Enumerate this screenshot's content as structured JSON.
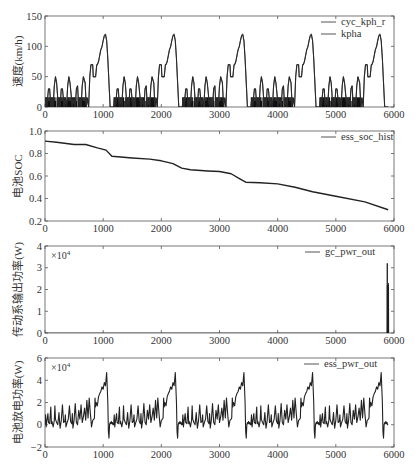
{
  "figure": {
    "x_ticks": [
      0,
      1000,
      2000,
      3000,
      4000,
      5000,
      6000
    ],
    "x_range": [
      0,
      6000
    ]
  },
  "chart_data": [
    {
      "type": "line",
      "ylabel": "速度(km/h)",
      "ylim": [
        0,
        150
      ],
      "y_ticks": [
        0,
        50,
        100,
        150
      ],
      "y_tick_labels": [
        "0",
        "50",
        "100",
        "150"
      ],
      "xlim": [
        0,
        6000
      ],
      "x_ticks": [
        0,
        1000,
        2000,
        3000,
        4000,
        5000,
        6000
      ],
      "multiplier_label": "",
      "legend": [
        "cyc_kph_r",
        "kpha"
      ],
      "legend_position": "upper right",
      "series": [
        {
          "name": "cyc_kph_r",
          "description": "5 repeated drive cycles (~1180 s each): 4 urban humps peaking ~50 km/h then extra-urban segment peaking ~120 km/h"
        },
        {
          "name": "kpha",
          "description": "achieved speed, overlapping cyc_kph_r"
        }
      ],
      "cycle_period_s": 1180,
      "cycle_template": {
        "t": [
          0,
          15,
          30,
          60,
          80,
          100,
          120,
          140,
          160,
          180,
          200,
          215,
          225,
          240,
          260,
          280,
          300,
          330,
          350,
          370,
          390,
          410,
          430,
          450,
          470,
          490,
          520,
          540,
          560,
          580,
          600,
          620,
          640,
          660,
          690,
          710,
          730,
          750,
          770,
          790,
          820,
          830,
          850,
          870,
          890,
          900,
          920,
          940,
          960,
          980,
          1000,
          1020,
          1040,
          1060,
          1080,
          1100,
          1120,
          1130,
          1150,
          1180
        ],
        "v": [
          0,
          15,
          0,
          30,
          30,
          0,
          15,
          0,
          35,
          50,
          40,
          20,
          0,
          15,
          0,
          30,
          30,
          0,
          15,
          0,
          35,
          50,
          40,
          20,
          0,
          15,
          0,
          30,
          35,
          0,
          15,
          0,
          35,
          50,
          40,
          0,
          15,
          0,
          50,
          70,
          70,
          50,
          50,
          50,
          70,
          70,
          75,
          85,
          95,
          100,
          110,
          118,
          120,
          110,
          80,
          40,
          0,
          0,
          0,
          0
        ]
      }
    },
    {
      "type": "line",
      "ylabel": "电池SOC",
      "ylim": [
        0.2,
        1.0
      ],
      "y_ticks": [
        0.2,
        0.4,
        0.6,
        0.8,
        1.0
      ],
      "y_tick_labels": [
        "0.2",
        "0.4",
        "0.6",
        "0.8",
        "1.0"
      ],
      "xlim": [
        0,
        6000
      ],
      "multiplier_label": "",
      "legend": [
        "ess_soc_hist"
      ],
      "legend_position": "upper right",
      "series": [
        {
          "name": "ess_soc_hist",
          "x": [
            0,
            200,
            500,
            700,
            900,
            1050,
            1150,
            1500,
            1800,
            2000,
            2200,
            2350,
            2500,
            2800,
            3000,
            3200,
            3350,
            3450,
            3700,
            4000,
            4300,
            4600,
            5000,
            5500,
            5900
          ],
          "y": [
            0.91,
            0.9,
            0.88,
            0.88,
            0.85,
            0.83,
            0.775,
            0.76,
            0.75,
            0.735,
            0.71,
            0.67,
            0.655,
            0.645,
            0.64,
            0.62,
            0.575,
            0.545,
            0.54,
            0.53,
            0.5,
            0.46,
            0.42,
            0.37,
            0.3
          ]
        }
      ]
    },
    {
      "type": "line",
      "ylabel": "传动系输出功率(W)",
      "ylim": [
        0,
        4
      ],
      "y_ticks": [
        0,
        1,
        2,
        3,
        4
      ],
      "y_tick_labels": [
        "0",
        "1",
        "2",
        "3",
        "4"
      ],
      "xlim": [
        0,
        6000
      ],
      "multiplier_label": "×10",
      "multiplier_exp": "4",
      "legend": [
        "gc_pwr_out"
      ],
      "legend_position": "upper right",
      "series": [
        {
          "name": "gc_pwr_out",
          "x": [
            0,
            5880,
            5885,
            5890,
            5895,
            5900,
            5905,
            5910
          ],
          "y": [
            0,
            0,
            3.2,
            0.2,
            2.2,
            0.1,
            2.3,
            0
          ],
          "description": "zero for whole run except a narrow burst near t≈5900 s reaching ~3.2×10^4 W"
        }
      ]
    },
    {
      "type": "line",
      "ylabel": "电池放电功率(W)",
      "ylim": [
        -2,
        6
      ],
      "y_ticks": [
        -2,
        0,
        2,
        4,
        6
      ],
      "y_tick_labels": [
        "−2",
        "0",
        "2",
        "4",
        "6"
      ],
      "xlim": [
        0,
        6000
      ],
      "multiplier_label": "×10",
      "multiplier_exp": "4",
      "legend": [
        "ess_pwr_out"
      ],
      "legend_position": "upper right",
      "series": [
        {
          "name": "ess_pwr_out",
          "description": "oscillating battery power; frequent spikes to ~1.5–2×10^4 W during urban humps, peaks ~4.7×10^4 W at end of each extra-urban segment (t≈1120, 2300, 3480, 4660, 5880), dips to ~-1.2×10^4 W",
          "cycle_period_s": 1180,
          "cycle_template": {
            "t": [
              0,
              10,
              20,
              30,
              40,
              50,
              60,
              80,
              100,
              110,
              120,
              140,
              160,
              170,
              180,
              200,
              220,
              240,
              250,
              260,
              280,
              300,
              320,
              340,
              350,
              360,
              380,
              400,
              420,
              440,
              460,
              470,
              480,
              500,
              520,
              540,
              560,
              580,
              600,
              620,
              640,
              660,
              680,
              700,
              720,
              740,
              760,
              780,
              800,
              820,
              840,
              850,
              860,
              870,
              880,
              900,
              920,
              940,
              960,
              980,
              1000,
              1020,
              1040,
              1060,
              1080,
              1090,
              1100,
              1110,
              1120,
              1130,
              1140,
              1150,
              1160,
              1170,
              1180
            ],
            "p": [
              0,
              0.9,
              -0.2,
              0.3,
              0.6,
              1.0,
              0.2,
              0.1,
              1.6,
              0.1,
              0.3,
              -0.2,
              0.4,
              1.7,
              0.5,
              0.2,
              0.0,
              1.1,
              0.3,
              -0.3,
              0.4,
              1.8,
              0.2,
              0.3,
              0.9,
              -0.2,
              0.2,
              0.5,
              1.7,
              0.3,
              0.1,
              1.0,
              -0.3,
              0.4,
              1.9,
              0.2,
              0.0,
              1.3,
              0.5,
              1.8,
              0.2,
              0.7,
              1.5,
              0.4,
              2.2,
              0.6,
              2.4,
              1.0,
              -0.2,
              0.4,
              0.5,
              0.6,
              2.4,
              1.6,
              2.0,
              1.7,
              2.5,
              2.8,
              3.0,
              3.4,
              3.2,
              3.8,
              3.5,
              4.7,
              2.0,
              -0.6,
              -1.2,
              0.0,
              0.2,
              0.1,
              0.3,
              0.1,
              0.2,
              0,
              0
            ]
          }
        }
      ]
    }
  ]
}
